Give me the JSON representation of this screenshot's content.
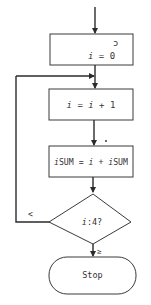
{
  "diagram": {
    "type": "flowchart",
    "colors": {
      "stroke": "#2b2b2b",
      "text": "#333333",
      "background": "#ffffff"
    },
    "nodes": [
      {
        "id": "init",
        "shape": "process",
        "faint_mark": "ɔ",
        "label_var": "i",
        "label_rest": " = 0"
      },
      {
        "id": "increment",
        "shape": "process",
        "label_var": "i",
        "label_mid": " = ",
        "label_var2": "i",
        "label_rest": " + 1"
      },
      {
        "id": "accumulate",
        "shape": "process",
        "label_var": "i",
        "label_mid": "SUM = ",
        "label_var2": "i",
        "label_mid2": " + ",
        "label_var3": "i",
        "label_rest": "SUM"
      },
      {
        "id": "check",
        "shape": "decision",
        "label_var": "i",
        "label_rest": ":4?"
      },
      {
        "id": "stop",
        "shape": "terminal",
        "label": "Stop"
      }
    ],
    "edges": [
      {
        "from": "entry",
        "to": "init"
      },
      {
        "from": "init",
        "to": "increment"
      },
      {
        "from": "increment",
        "to": "accumulate"
      },
      {
        "from": "accumulate",
        "to": "check"
      },
      {
        "from": "check",
        "to": "increment",
        "label": "<"
      },
      {
        "from": "check",
        "to": "stop",
        "label": "≥"
      }
    ]
  }
}
